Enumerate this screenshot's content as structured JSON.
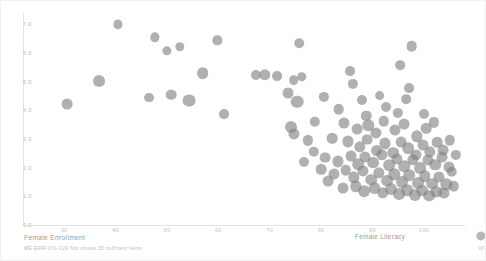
{
  "chart_data": {
    "type": "scatter",
    "title": "",
    "xlabel": "Female Enrollment",
    "ylabel": "",
    "xlim": [
      22,
      108
    ],
    "ylim": [
      0.0,
      7.4
    ],
    "xticks": [
      30,
      40,
      50,
      60,
      70,
      80,
      90,
      100
    ],
    "yticks": [
      "7.0",
      "6.0",
      "5.0",
      "4.0",
      "3.0",
      "2.0",
      "1.0",
      "0.0"
    ],
    "grid": false,
    "size_legend": {
      "title": "Female Literacy",
      "values": [
        30,
        70,
        113
      ]
    },
    "marker_color": "#7f7f7f",
    "marker_opacity": 0.62,
    "footnote": "ME-ERR-VIG-029 Not shown 55 null/zero items",
    "points": [
      {
        "x": 40.2,
        "y": 7.0,
        "s": 30
      },
      {
        "x": 47.4,
        "y": 6.55,
        "s": 31
      },
      {
        "x": 49.8,
        "y": 6.08,
        "s": 31
      },
      {
        "x": 52.3,
        "y": 6.22,
        "s": 32
      },
      {
        "x": 59.6,
        "y": 6.45,
        "s": 31
      },
      {
        "x": 75.6,
        "y": 6.35,
        "s": 33
      },
      {
        "x": 36.6,
        "y": 5.02,
        "s": 58
      },
      {
        "x": 56.8,
        "y": 5.3,
        "s": 55
      },
      {
        "x": 67.2,
        "y": 5.22,
        "s": 38
      },
      {
        "x": 68.8,
        "y": 5.25,
        "s": 52
      },
      {
        "x": 71.2,
        "y": 5.2,
        "s": 36
      },
      {
        "x": 74.5,
        "y": 5.05,
        "s": 34
      },
      {
        "x": 76.0,
        "y": 5.18,
        "s": 33
      },
      {
        "x": 86.0,
        "y": 4.92,
        "s": 40
      },
      {
        "x": 97.0,
        "y": 4.78,
        "s": 36
      },
      {
        "x": 30.4,
        "y": 4.22,
        "s": 46
      },
      {
        "x": 46.4,
        "y": 4.45,
        "s": 36
      },
      {
        "x": 50.6,
        "y": 4.55,
        "s": 44
      },
      {
        "x": 54.2,
        "y": 4.34,
        "s": 70
      },
      {
        "x": 61.0,
        "y": 3.88,
        "s": 36
      },
      {
        "x": 73.4,
        "y": 4.6,
        "s": 48
      },
      {
        "x": 75.2,
        "y": 4.3,
        "s": 68
      },
      {
        "x": 80.4,
        "y": 4.48,
        "s": 40
      },
      {
        "x": 92.4,
        "y": 4.12,
        "s": 37
      },
      {
        "x": 83.2,
        "y": 4.05,
        "s": 44
      },
      {
        "x": 88.6,
        "y": 3.82,
        "s": 42
      },
      {
        "x": 97.4,
        "y": 6.25,
        "s": 45
      },
      {
        "x": 74.0,
        "y": 3.42,
        "s": 60
      },
      {
        "x": 74.6,
        "y": 3.18,
        "s": 50
      },
      {
        "x": 78.6,
        "y": 3.6,
        "s": 41
      },
      {
        "x": 84.2,
        "y": 3.55,
        "s": 48
      },
      {
        "x": 86.8,
        "y": 3.35,
        "s": 46
      },
      {
        "x": 89.0,
        "y": 3.48,
        "s": 54
      },
      {
        "x": 90.4,
        "y": 3.2,
        "s": 50
      },
      {
        "x": 92.0,
        "y": 3.62,
        "s": 44
      },
      {
        "x": 94.2,
        "y": 3.3,
        "s": 48
      },
      {
        "x": 96.0,
        "y": 3.52,
        "s": 46
      },
      {
        "x": 98.4,
        "y": 3.1,
        "s": 52
      },
      {
        "x": 100.2,
        "y": 3.38,
        "s": 44
      },
      {
        "x": 101.8,
        "y": 3.58,
        "s": 40
      },
      {
        "x": 82.0,
        "y": 3.02,
        "s": 44
      },
      {
        "x": 85.0,
        "y": 2.92,
        "s": 50
      },
      {
        "x": 87.4,
        "y": 2.72,
        "s": 52
      },
      {
        "x": 88.8,
        "y": 2.98,
        "s": 46
      },
      {
        "x": 90.6,
        "y": 2.6,
        "s": 58
      },
      {
        "x": 92.2,
        "y": 2.85,
        "s": 50
      },
      {
        "x": 93.8,
        "y": 2.52,
        "s": 54
      },
      {
        "x": 95.4,
        "y": 2.9,
        "s": 46
      },
      {
        "x": 96.8,
        "y": 2.68,
        "s": 56
      },
      {
        "x": 98.2,
        "y": 2.44,
        "s": 50
      },
      {
        "x": 99.6,
        "y": 2.8,
        "s": 48
      },
      {
        "x": 101.0,
        "y": 2.56,
        "s": 52
      },
      {
        "x": 102.4,
        "y": 2.88,
        "s": 44
      },
      {
        "x": 103.6,
        "y": 2.62,
        "s": 46
      },
      {
        "x": 104.8,
        "y": 2.95,
        "s": 42
      },
      {
        "x": 80.6,
        "y": 2.35,
        "s": 46
      },
      {
        "x": 83.0,
        "y": 2.22,
        "s": 50
      },
      {
        "x": 85.6,
        "y": 2.42,
        "s": 48
      },
      {
        "x": 87.0,
        "y": 2.12,
        "s": 54
      },
      {
        "x": 88.4,
        "y": 2.38,
        "s": 50
      },
      {
        "x": 90.0,
        "y": 2.18,
        "s": 58
      },
      {
        "x": 91.6,
        "y": 2.45,
        "s": 52
      },
      {
        "x": 93.0,
        "y": 2.08,
        "s": 56
      },
      {
        "x": 94.6,
        "y": 2.32,
        "s": 50
      },
      {
        "x": 96.0,
        "y": 2.05,
        "s": 54
      },
      {
        "x": 97.6,
        "y": 2.28,
        "s": 52
      },
      {
        "x": 99.0,
        "y": 2.0,
        "s": 58
      },
      {
        "x": 100.6,
        "y": 2.26,
        "s": 50
      },
      {
        "x": 102.0,
        "y": 2.1,
        "s": 54
      },
      {
        "x": 103.4,
        "y": 2.36,
        "s": 46
      },
      {
        "x": 104.6,
        "y": 2.04,
        "s": 48
      },
      {
        "x": 82.4,
        "y": 1.78,
        "s": 48
      },
      {
        "x": 84.6,
        "y": 1.92,
        "s": 44
      },
      {
        "x": 86.2,
        "y": 1.66,
        "s": 52
      },
      {
        "x": 88.0,
        "y": 1.88,
        "s": 50
      },
      {
        "x": 89.6,
        "y": 1.58,
        "s": 56
      },
      {
        "x": 91.0,
        "y": 1.82,
        "s": 52
      },
      {
        "x": 92.6,
        "y": 1.55,
        "s": 58
      },
      {
        "x": 94.0,
        "y": 1.78,
        "s": 54
      },
      {
        "x": 95.6,
        "y": 1.5,
        "s": 60
      },
      {
        "x": 97.0,
        "y": 1.74,
        "s": 56
      },
      {
        "x": 98.6,
        "y": 1.46,
        "s": 58
      },
      {
        "x": 100.0,
        "y": 1.7,
        "s": 54
      },
      {
        "x": 101.4,
        "y": 1.44,
        "s": 56
      },
      {
        "x": 102.8,
        "y": 1.68,
        "s": 50
      },
      {
        "x": 104.2,
        "y": 1.42,
        "s": 52
      },
      {
        "x": 84.0,
        "y": 1.28,
        "s": 48
      },
      {
        "x": 86.6,
        "y": 1.35,
        "s": 52
      },
      {
        "x": 88.2,
        "y": 1.18,
        "s": 56
      },
      {
        "x": 90.2,
        "y": 1.3,
        "s": 58
      },
      {
        "x": 91.8,
        "y": 1.12,
        "s": 54
      },
      {
        "x": 93.4,
        "y": 1.26,
        "s": 60
      },
      {
        "x": 95.0,
        "y": 1.08,
        "s": 58
      },
      {
        "x": 96.6,
        "y": 1.22,
        "s": 56
      },
      {
        "x": 98.0,
        "y": 1.05,
        "s": 62
      },
      {
        "x": 99.4,
        "y": 1.2,
        "s": 58
      },
      {
        "x": 100.8,
        "y": 1.02,
        "s": 56
      },
      {
        "x": 102.2,
        "y": 1.16,
        "s": 52
      },
      {
        "x": 103.8,
        "y": 1.1,
        "s": 48
      },
      {
        "x": 78.4,
        "y": 2.55,
        "s": 42
      },
      {
        "x": 79.8,
        "y": 1.95,
        "s": 44
      },
      {
        "x": 81.2,
        "y": 1.52,
        "s": 46
      },
      {
        "x": 77.2,
        "y": 2.95,
        "s": 40
      },
      {
        "x": 76.4,
        "y": 2.2,
        "s": 38
      },
      {
        "x": 105.6,
        "y": 1.35,
        "s": 44
      },
      {
        "x": 105.2,
        "y": 1.85,
        "s": 42
      },
      {
        "x": 106.0,
        "y": 2.45,
        "s": 40
      },
      {
        "x": 94.8,
        "y": 3.92,
        "s": 40
      },
      {
        "x": 99.8,
        "y": 3.86,
        "s": 38
      },
      {
        "x": 87.8,
        "y": 4.35,
        "s": 38
      },
      {
        "x": 91.2,
        "y": 4.52,
        "s": 36
      },
      {
        "x": 96.4,
        "y": 4.4,
        "s": 34
      },
      {
        "x": 85.4,
        "y": 5.38,
        "s": 36
      },
      {
        "x": 95.2,
        "y": 5.58,
        "s": 34
      }
    ]
  }
}
